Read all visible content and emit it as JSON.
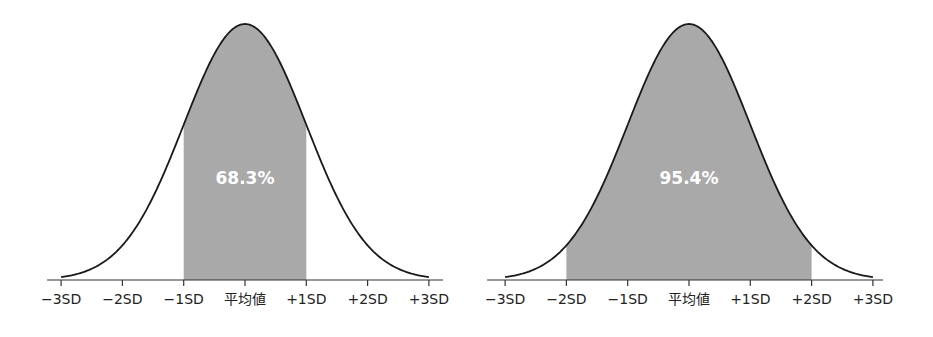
{
  "chart_data": [
    {
      "type": "area",
      "title": "",
      "distribution": "normal",
      "shaded_range_sd": [
        -1,
        1
      ],
      "shaded_label": "68.3%",
      "shaded_percent": 68.3,
      "categories": [
        "−3SD",
        "−2SD",
        "−1SD",
        "平均値",
        "+1SD",
        "+2SD",
        "+3SD"
      ],
      "x_sd": [
        -3,
        -2,
        -1,
        0,
        1,
        2,
        3
      ],
      "xlabel": "",
      "ylabel": "",
      "xlim_sd": [
        -3,
        3
      ],
      "grid": false,
      "legend": "none"
    },
    {
      "type": "area",
      "title": "",
      "distribution": "normal",
      "shaded_range_sd": [
        -2,
        2
      ],
      "shaded_label": "95.4%",
      "shaded_percent": 95.4,
      "categories": [
        "−3SD",
        "−2SD",
        "−1SD",
        "平均値",
        "+1SD",
        "+2SD",
        "+3SD"
      ],
      "x_sd": [
        -3,
        -2,
        -1,
        0,
        1,
        2,
        3
      ],
      "xlabel": "",
      "ylabel": "",
      "xlim_sd": [
        -3,
        3
      ],
      "grid": false,
      "legend": "none"
    }
  ],
  "colors": {
    "fill": "#a9a9a9",
    "curve": "#1a1a1a",
    "axis": "#333333",
    "label_text": "#222222",
    "percent_text": "#ffffff"
  },
  "left": {
    "percent_label": "68.3%",
    "ticks": [
      "−3SD",
      "−2SD",
      "−1SD",
      "平均値",
      "+1SD",
      "+2SD",
      "+3SD"
    ]
  },
  "right": {
    "percent_label": "95.4%",
    "ticks": [
      "−3SD",
      "−2SD",
      "−1SD",
      "平均値",
      "+1SD",
      "+2SD",
      "+3SD"
    ]
  }
}
